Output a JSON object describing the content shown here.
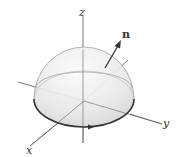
{
  "figure": {
    "type": "hemisphere-surface-with-normal",
    "labels": {
      "z_axis": "z",
      "y_axis": "y",
      "x_axis": "x",
      "normal_vector": "n"
    },
    "colors": {
      "surface_fill": "#e6e6e6",
      "surface_outline": "#9a9a9a",
      "boundary_curve": "#333333",
      "axes": "#555555",
      "arrow": "#333333"
    }
  }
}
